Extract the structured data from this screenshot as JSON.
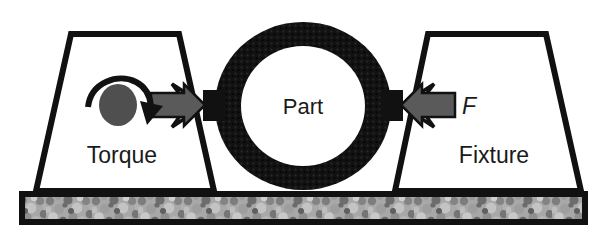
{
  "figure": {
    "kind": "engineering-schematic",
    "background_color": "#ffffff"
  },
  "colors": {
    "outline": "#111111",
    "ring_fill": "#111111",
    "arrow_gray": "#5a5a5a",
    "arrow_outline": "#111111",
    "torque_disc": "#4f4f4f",
    "base_texture_light": "#b9b9b9",
    "base_texture_dark": "#6e6e6e",
    "clamp_white": "#ffffff",
    "text": "#1a1a1a"
  },
  "labels": {
    "part": "Part",
    "torque": "Torque",
    "fixture": "Fixture",
    "force": "F"
  },
  "elements": {
    "left_fixture_name": "left-fixture-trapezoid",
    "right_fixture_name": "right-fixture-trapezoid",
    "ring_name": "part-ring",
    "base_name": "ground-base"
  },
  "geometry": {
    "canvas_width": 608,
    "canvas_height": 241,
    "ring_center_x": 303,
    "ring_center_y": 106,
    "ring_outer_rx": 88,
    "ring_outer_ry": 84,
    "ring_inner_rx": 62,
    "ring_inner_ry": 60,
    "base_top_y": 194,
    "base_bottom_y": 222
  }
}
